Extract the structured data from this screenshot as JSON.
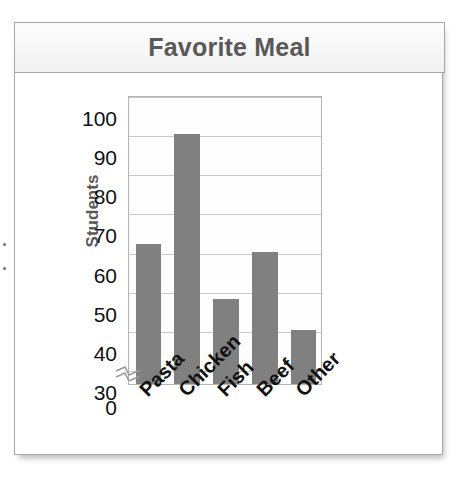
{
  "chart_data": {
    "type": "bar",
    "title": "Favorite Meal",
    "xlabel": "",
    "ylabel": "Students",
    "categories": [
      "Pasta",
      "Chicken",
      "Fish",
      "Beef",
      "Other"
    ],
    "values": [
      62,
      90,
      48,
      60,
      40
    ],
    "ylim": [
      0,
      100
    ],
    "y_ticks": [
      100,
      90,
      80,
      70,
      60,
      50,
      40,
      30,
      0
    ],
    "gridlines": [
      100,
      90,
      80,
      70,
      60,
      50,
      40,
      30
    ],
    "axis_break": true,
    "axis_break_between": [
      0,
      30
    ],
    "grid": true,
    "legend": false,
    "bar_color": "#808080",
    "plot_background": "#fdfdfd",
    "gridline_color": "#c9c9c9",
    "title_color": "#595959",
    "axis_label_color": "#5a5a5a",
    "tick_label_color": "#111111",
    "x_label_rotation": -45
  }
}
